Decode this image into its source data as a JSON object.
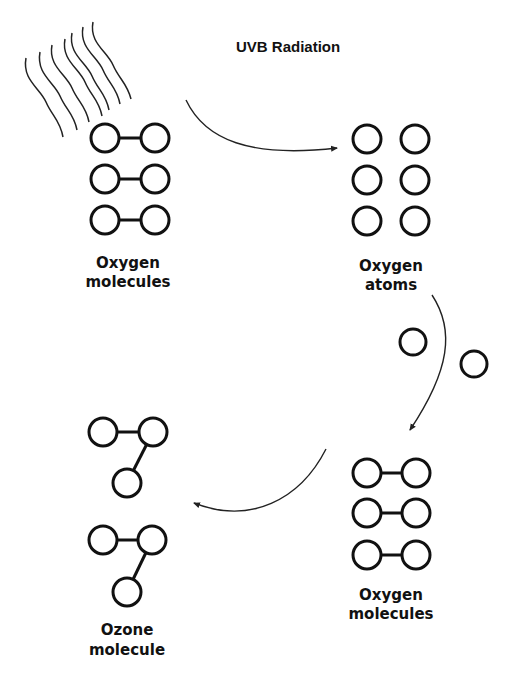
{
  "diagram": {
    "title": "UVB Radiation",
    "stages": [
      {
        "id": "oxygen-molecules-1",
        "label_line1": "Oxygen",
        "label_line2": "molecules"
      },
      {
        "id": "oxygen-atoms",
        "label_line1": "Oxygen",
        "label_line2": "atoms"
      },
      {
        "id": "oxygen-molecules-2",
        "label_line1": "Oxygen",
        "label_line2": "molecules"
      },
      {
        "id": "ozone-molecule",
        "label_line1": "Ozone",
        "label_line2": "molecule"
      }
    ],
    "icons": {
      "radiation": "uv-radiation-waves-icon",
      "atom": "circle",
      "bond": "line"
    },
    "colors": {
      "stroke": "#111111",
      "background": "#ffffff"
    }
  }
}
